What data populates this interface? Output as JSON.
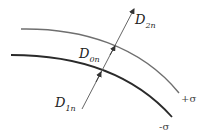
{
  "diagram": {
    "type": "boundary-surface-charge-displacement",
    "surfaces": [
      {
        "id": "upper",
        "charge_label": "+σ",
        "color": "#6f6f6f"
      },
      {
        "id": "lower",
        "charge_label": "-σ",
        "color": "#2a2a2a"
      }
    ],
    "vectors": {
      "D2n": {
        "base": "D",
        "sub": "2n"
      },
      "D0n": {
        "base": "D",
        "sub": "0n"
      },
      "D1n": {
        "base": "D",
        "sub": "1n"
      }
    },
    "arrow_color": "#555555"
  }
}
